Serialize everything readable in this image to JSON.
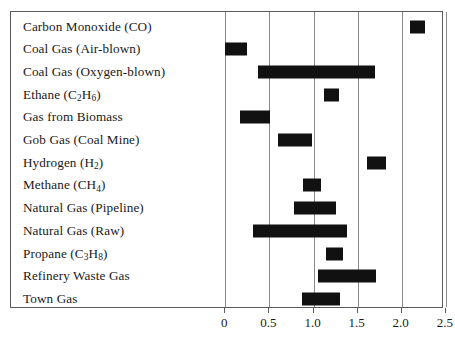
{
  "chart_data": {
    "type": "bar",
    "orientation": "horizontal",
    "subtype": "range-bar",
    "title": "",
    "xlabel": "",
    "ylabel": "",
    "xlim": [
      -0.25,
      2.62
    ],
    "xticks": [
      "0",
      "0.5",
      "1.0",
      "1.5",
      "2.0",
      "2.5"
    ],
    "xtick_values": [
      0,
      0.5,
      1.0,
      1.5,
      2.0,
      2.5
    ],
    "grid": "vertical",
    "legend": "none",
    "bar_color": "#111111",
    "categories": [
      "Carbon Monoxide (CO)",
      "Coal Gas (Air-blown)",
      "Coal Gas (Oxygen-blown)",
      "Ethane (C2H6)",
      "Gas from Biomass",
      "Gob Gas (Coal Mine)",
      "Hydrogen (H2)",
      "Methane (CH4)",
      "Natural Gas (Pipeline)",
      "Natural Gas (Raw)",
      "Propane (C3H8)",
      "Refinery Waste Gas",
      "Town Gas"
    ],
    "ranges": [
      [
        2.09,
        2.26
      ],
      [
        0.0,
        0.25
      ],
      [
        0.37,
        1.7
      ],
      [
        1.12,
        1.29
      ],
      [
        0.17,
        0.51
      ],
      [
        0.6,
        0.98
      ],
      [
        1.61,
        1.82
      ],
      [
        0.88,
        1.08
      ],
      [
        0.78,
        1.25
      ],
      [
        0.31,
        1.38
      ],
      [
        1.14,
        1.33
      ],
      [
        1.05,
        1.71
      ],
      [
        0.87,
        1.3
      ]
    ]
  },
  "rows": [
    {
      "label_main": "Carbon Monoxide (CO)",
      "sub_parts": null,
      "low": 2.09,
      "high": 2.26
    },
    {
      "label_main": "Coal Gas (Air-blown)",
      "sub_parts": null,
      "low": 0.0,
      "high": 0.25
    },
    {
      "label_main": "Coal Gas (Oxygen-blown)",
      "sub_parts": null,
      "low": 0.37,
      "high": 1.7
    },
    {
      "label_main": "Ethane (C",
      "sub_parts": [
        "2",
        "H",
        "6",
        ")"
      ],
      "low": 1.12,
      "high": 1.29
    },
    {
      "label_main": "Gas from Biomass",
      "sub_parts": null,
      "low": 0.17,
      "high": 0.51
    },
    {
      "label_main": "Gob Gas (Coal Mine)",
      "sub_parts": null,
      "low": 0.6,
      "high": 0.98
    },
    {
      "label_main": "Hydrogen (H",
      "sub_parts": [
        "2",
        "",
        "",
        ")"
      ],
      "low": 1.61,
      "high": 1.82
    },
    {
      "label_main": "Methane (CH",
      "sub_parts": [
        "4",
        "",
        "",
        ")"
      ],
      "low": 0.88,
      "high": 1.08
    },
    {
      "label_main": "Natural Gas (Pipeline)",
      "sub_parts": null,
      "low": 0.78,
      "high": 1.25
    },
    {
      "label_main": "Natural Gas (Raw)",
      "sub_parts": null,
      "low": 0.31,
      "high": 1.38
    },
    {
      "label_main": "Propane (C",
      "sub_parts": [
        "3",
        "H",
        "8",
        ")"
      ],
      "low": 1.14,
      "high": 1.33
    },
    {
      "label_main": "Refinery Waste Gas",
      "sub_parts": null,
      "low": 1.05,
      "high": 1.71
    },
    {
      "label_main": "Town Gas",
      "sub_parts": null,
      "low": 0.87,
      "high": 1.3
    }
  ],
  "axis": {
    "tick_labels": [
      "0",
      "0.5",
      "1.0",
      "1.5",
      "2.0",
      "2.5"
    ],
    "tick_values": [
      0,
      0.5,
      1.0,
      1.5,
      2.0,
      2.5
    ]
  },
  "geometry": {
    "x0_px": 224.3,
    "px_per_unit": 88.2,
    "panel_left": 10,
    "panel_top": 11,
    "row_top": 14,
    "row_height": 22.7
  }
}
